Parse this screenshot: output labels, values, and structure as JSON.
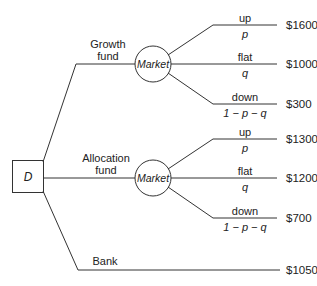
{
  "decision_node": {
    "label": "D"
  },
  "alternatives": [
    {
      "name_line1": "Growth",
      "name_line2": "fund",
      "chance_node": "Market",
      "outcomes": [
        {
          "state": "up",
          "prob": "p",
          "payoff": "$1600"
        },
        {
          "state": "flat",
          "prob": "q",
          "payoff": "$1000"
        },
        {
          "state": "down",
          "prob": "1 − p − q",
          "payoff": "$300"
        }
      ]
    },
    {
      "name_line1": "Allocation",
      "name_line2": "fund",
      "chance_node": "Market",
      "outcomes": [
        {
          "state": "up",
          "prob": "p",
          "payoff": "$1300"
        },
        {
          "state": "flat",
          "prob": "q",
          "payoff": "$1200"
        },
        {
          "state": "down",
          "prob": "1 − p − q",
          "payoff": "$700"
        }
      ]
    },
    {
      "name_line1": "Bank",
      "payoff": "$1050"
    }
  ],
  "colors": {
    "line": "#333333",
    "text": "#222222",
    "background": "#ffffff"
  }
}
